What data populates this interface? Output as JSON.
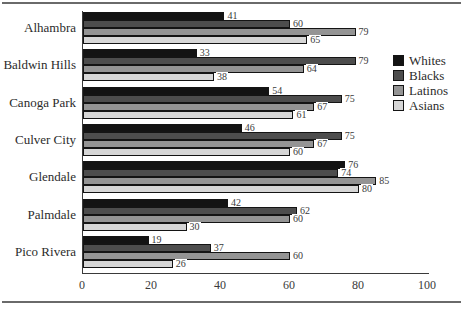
{
  "figure": {
    "top_rule_color": "#6a6a6a",
    "bottom_rule_color": "#6a6a6a",
    "background": "#ffffff",
    "axis_color": "#3a3a3a"
  },
  "chart_data": {
    "type": "bar",
    "orientation": "horizontal",
    "title": "",
    "categories": [
      "Alhambra",
      "Baldwin Hills",
      "Canoga Park",
      "Culver City",
      "Glendale",
      "Palmdale",
      "Pico Rivera"
    ],
    "series": [
      {
        "name": "Whites",
        "color": "#131313",
        "values": [
          41,
          33,
          54,
          46,
          76,
          42,
          19
        ]
      },
      {
        "name": "Blacks",
        "color": "#4d4d4d",
        "values": [
          60,
          79,
          75,
          75,
          74,
          62,
          37
        ]
      },
      {
        "name": "Latinos",
        "color": "#949494",
        "values": [
          79,
          64,
          67,
          67,
          85,
          60,
          60
        ]
      },
      {
        "name": "Asians",
        "color": "#d6d6d6",
        "values": [
          65,
          38,
          61,
          60,
          80,
          30,
          26
        ]
      }
    ],
    "xlabel": "",
    "ylabel": "",
    "xlim": [
      0,
      100
    ],
    "x_ticks": [
      "0",
      "20",
      "40",
      "60",
      "80",
      "100"
    ],
    "x_tick_values": [
      0,
      20,
      40,
      60,
      80,
      100
    ],
    "bar_outline_color": "#141414",
    "value_labels_shown": true,
    "legend_position": "right",
    "grid": false
  }
}
